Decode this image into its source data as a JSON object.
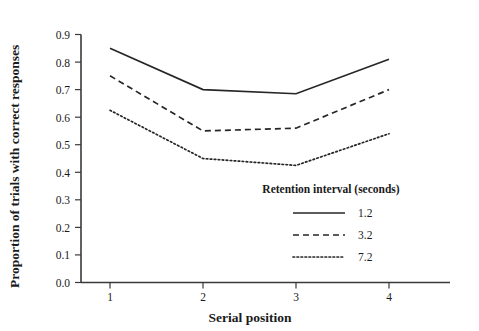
{
  "chart_data": {
    "type": "line",
    "title": "",
    "xlabel": "Serial position",
    "ylabel": "Proportion of trials with correct responses",
    "x": [
      1,
      2,
      3,
      4
    ],
    "xtick_labels": [
      "1",
      "2",
      "3",
      "4"
    ],
    "ytick_labels": [
      "0.0",
      "0.1",
      "0.2",
      "0.3",
      "0.4",
      "0.5",
      "0.6",
      "0.7",
      "0.8",
      "0.9"
    ],
    "ytick_values": [
      0.0,
      0.1,
      0.2,
      0.3,
      0.4,
      0.5,
      0.6,
      0.7,
      0.8,
      0.9
    ],
    "xlim": [
      0.6,
      4.4
    ],
    "ylim": [
      0.0,
      0.9
    ],
    "grid": false,
    "legend_position": "lower-right-inside",
    "legend_title": "Retention interval (seconds)",
    "series": [
      {
        "name": "1.2",
        "style": "solid",
        "values": [
          0.85,
          0.7,
          0.685,
          0.81
        ]
      },
      {
        "name": "3.2",
        "style": "dashed",
        "values": [
          0.75,
          0.55,
          0.56,
          0.7
        ]
      },
      {
        "name": "7.2",
        "style": "dotted",
        "values": [
          0.625,
          0.45,
          0.425,
          0.54
        ]
      }
    ],
    "colors": {
      "axis": "#3a3a3a",
      "line": "#262626",
      "background": "#ffffff",
      "text": "#1a1a1a"
    }
  }
}
